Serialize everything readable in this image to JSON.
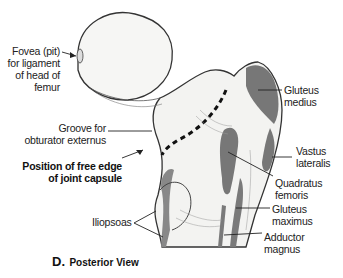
{
  "figure": {
    "caption_letter": "D.",
    "caption_text": "Posterior View"
  },
  "labels": {
    "fovea": [
      "Fovea (pit)",
      "for ligament",
      "of head of",
      "femur"
    ],
    "groove": [
      "Groove for",
      "obturator externus"
    ],
    "capsule": [
      "Position of free edge",
      "of joint capsule"
    ],
    "iliopsoas": "Iliopsoas",
    "gluteus_medius": [
      "Gluteus",
      "medius"
    ],
    "vastus_lateralis": [
      "Vastus",
      "lateralis"
    ],
    "quadratus_femoris": [
      "Quadratus",
      "femoris"
    ],
    "gluteus_maximus": [
      "Gluteus",
      "maximus"
    ],
    "adductor_magnus": [
      "Adductor",
      "magnus"
    ]
  },
  "colors": {
    "bone": "#f4f4f2",
    "muscle_attachment": "#777777",
    "outline": "#333333",
    "text": "#222222"
  }
}
